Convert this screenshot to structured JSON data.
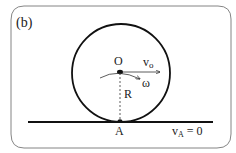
{
  "panel": {
    "label": "(b)"
  },
  "labels": {
    "center": "O",
    "velocity": "v",
    "velocity_sub": "o",
    "omega": "ω",
    "radius": "R",
    "contact": "A",
    "contact_velocity": "v",
    "contact_velocity_sub": "A",
    "contact_velocity_eq": " = 0"
  },
  "colors": {
    "stroke": "#111111",
    "frame": "#666666",
    "text": "#222222"
  }
}
